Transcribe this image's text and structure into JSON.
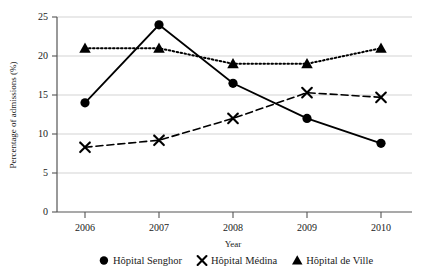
{
  "chart_data": {
    "type": "line",
    "title": "",
    "xlabel": "Year",
    "ylabel": "Percentage of admissions (%)",
    "categories": [
      "2006",
      "2007",
      "2008",
      "2009",
      "2010"
    ],
    "x": [
      2006,
      2007,
      2008,
      2009,
      2010
    ],
    "xlim": [
      2005.6,
      2010.4
    ],
    "ylim": [
      0,
      25
    ],
    "yticks": [
      0,
      5,
      10,
      15,
      20,
      25
    ],
    "ytick_labels": [
      "0",
      "5",
      "10",
      "15",
      "20",
      "25"
    ],
    "grid": "horizontal",
    "legend_position": "bottom",
    "series": [
      {
        "name": "Hôpital Senghor",
        "marker": "circle",
        "linestyle": "solid",
        "color": "#000000",
        "values": [
          14.0,
          24.0,
          16.5,
          12.0,
          8.8
        ]
      },
      {
        "name": "Hôpital Médina",
        "marker": "x",
        "linestyle": "dashed",
        "color": "#000000",
        "values": [
          8.3,
          9.2,
          12.0,
          15.3,
          14.7
        ]
      },
      {
        "name": "Hôpital de Ville",
        "marker": "triangle",
        "linestyle": "dotted",
        "color": "#000000",
        "values": [
          21.0,
          21.0,
          19.0,
          19.0,
          21.0
        ]
      }
    ]
  },
  "axes": {
    "y_title": "Percentage of admissions (%)",
    "x_title": "Year",
    "ytick_0": "0",
    "ytick_1": "5",
    "ytick_2": "10",
    "ytick_3": "15",
    "ytick_4": "20",
    "ytick_5": "25",
    "xtick_0": "2006",
    "xtick_1": "2007",
    "xtick_2": "2008",
    "xtick_3": "2009",
    "xtick_4": "2010"
  },
  "legend": {
    "items": [
      {
        "label": "Hôpital Senghor",
        "marker": "circle-marker-icon"
      },
      {
        "label": "Hôpital Médina",
        "marker": "x-marker-icon"
      },
      {
        "label": "Hôpital de Ville",
        "marker": "triangle-marker-icon"
      }
    ]
  }
}
